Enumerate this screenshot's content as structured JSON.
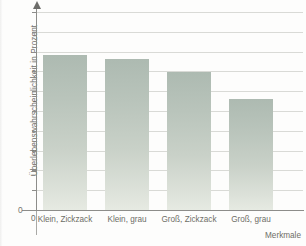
{
  "chart_data": {
    "type": "bar",
    "title": "",
    "xlabel": "Merkmale",
    "ylabel": "Überlebenswahrscheinlichkeit in Prozent",
    "categories": [
      "Klein, Zickzack",
      "Klein, grau",
      "Groß, Zickzack",
      "Groß, grau"
    ],
    "values": [
      78.5,
      76.5,
      69.5,
      56
    ],
    "ylim": [
      0,
      100
    ],
    "yticks": [
      0,
      10,
      20,
      30,
      40,
      50,
      60,
      70,
      80,
      90,
      100
    ],
    "ytick_labels": [
      "0",
      "10",
      "20",
      "30",
      "40",
      "50",
      "60",
      "70",
      "80",
      "90",
      "100"
    ],
    "grid": true,
    "legend": null,
    "bar_color": "#bcc6bd",
    "gridline_color": "#d9dad6",
    "axis_color": "#8d8d8a",
    "origin_label_y": "0",
    "origin_label_x": "0"
  }
}
